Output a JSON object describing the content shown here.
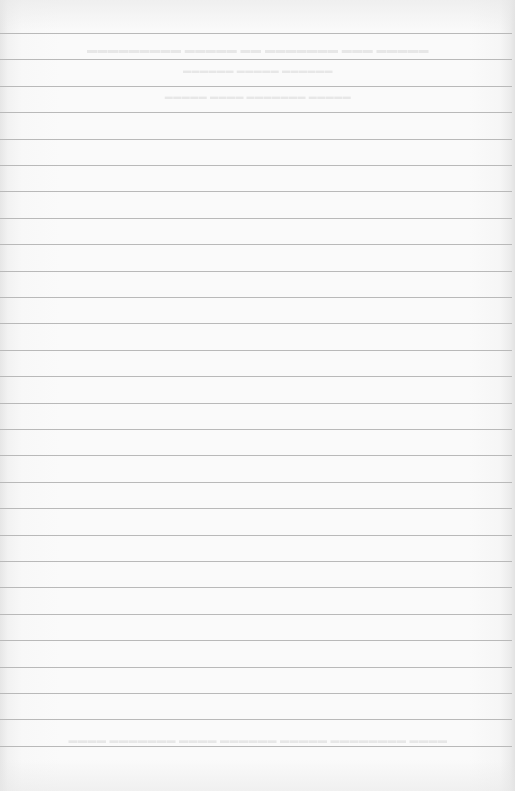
{
  "page": {
    "type": "ruled-notebook-page",
    "paper_color": "#fafafa",
    "rule_color": "#b9b9b9",
    "rule_count": 28,
    "first_rule_y": 33,
    "rule_spacing": 26.4,
    "handwritten_content": "",
    "bleed_through": {
      "visible": true,
      "legible": false,
      "regions": [
        "top",
        "bottom"
      ]
    }
  }
}
